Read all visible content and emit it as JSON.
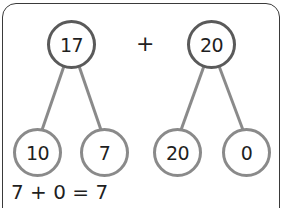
{
  "diagram": {
    "type": "part-whole number bonds",
    "operator": "+",
    "colors": {
      "frame_border": "#3a3a3a",
      "whole_circle_border": "#5a5a5a",
      "part_circle_border": "#8a8a8a",
      "connector": "#8a8a8a",
      "text": "#1f1f1f"
    },
    "bonds": [
      {
        "whole": "17",
        "parts": [
          "10",
          "7"
        ]
      },
      {
        "whole": "20",
        "parts": [
          "20",
          "0"
        ]
      }
    ],
    "equation": "7 + 0 = 7"
  }
}
